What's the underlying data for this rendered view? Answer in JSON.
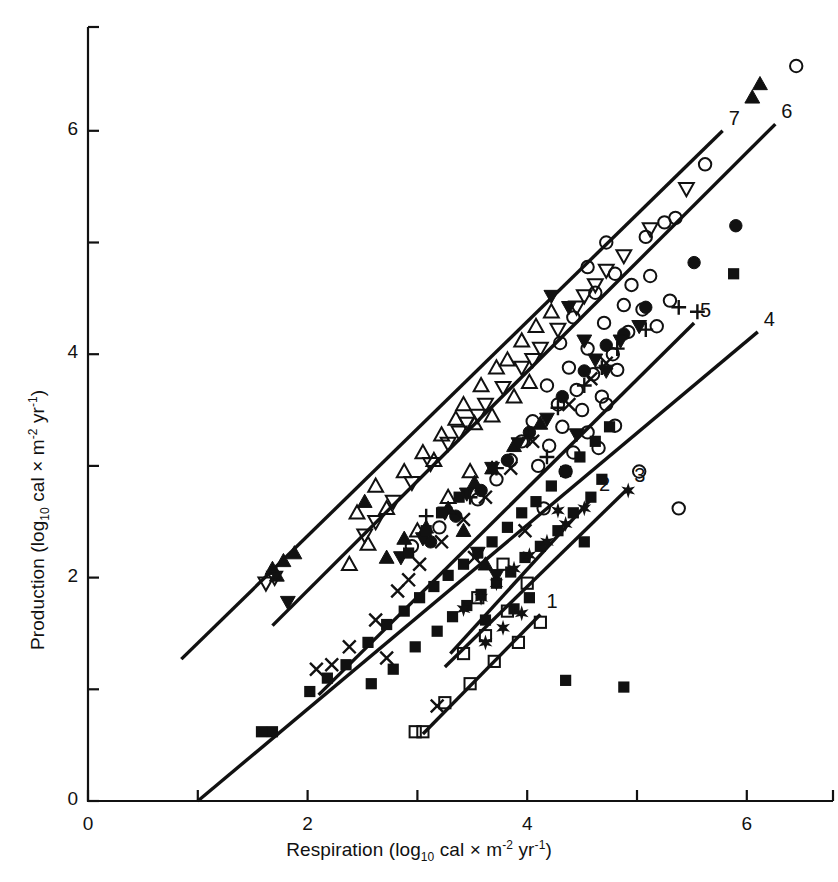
{
  "figure": {
    "background": "#ffffff",
    "ink": "#111111"
  },
  "axes": {
    "x": {
      "title_main": "Respiration (log",
      "title_sub": "10",
      "title_mid": " cal × m",
      "title_sup1": "-2",
      "title_mid2": " yr",
      "title_sup2": "-1",
      "title_end": ")",
      "ticks": [
        {
          "value": 0,
          "label": "0"
        },
        {
          "value": 1,
          "label": ""
        },
        {
          "value": 2,
          "label": "2"
        },
        {
          "value": 3,
          "label": ""
        },
        {
          "value": 4,
          "label": "4"
        },
        {
          "value": 5,
          "label": ""
        },
        {
          "value": 6,
          "label": "6"
        }
      ],
      "min": 0,
      "max": 6.8
    },
    "y": {
      "title_main": "Production (log",
      "title_sub": "10",
      "title_mid": " cal × m",
      "title_sup1": "-2",
      "title_mid2": " yr",
      "title_sup2": "-1",
      "title_end": ")",
      "ticks": [
        {
          "value": 0,
          "label": "0"
        },
        {
          "value": 1,
          "label": ""
        },
        {
          "value": 2,
          "label": "2"
        },
        {
          "value": 3,
          "label": ""
        },
        {
          "value": 4,
          "label": "4"
        },
        {
          "value": 5,
          "label": ""
        },
        {
          "value": 6,
          "label": "6"
        }
      ],
      "min": 0,
      "max": 6.9
    }
  },
  "chart_data": {
    "type": "scatter",
    "title": "",
    "xlabel": "Respiration (log10 cal × m-2 yr-1)",
    "ylabel": "Production (log10 cal × m-2 yr-1)",
    "xlim": [
      0,
      6.8
    ],
    "ylim": [
      0,
      6.9
    ],
    "grid": false,
    "legend": "none",
    "line_labels": [
      "1",
      "2",
      "3",
      "4",
      "5",
      "6",
      "7"
    ],
    "fit_lines": [
      {
        "label": "1",
        "x0": 3.05,
        "y0": 0.6,
        "x1": 4.12,
        "y1": 1.67
      },
      {
        "label": "2",
        "x0": 3.3,
        "y0": 1.32,
        "x1": 4.6,
        "y1": 2.72
      },
      {
        "label": "3",
        "x0": 3.25,
        "y0": 1.2,
        "x1": 4.92,
        "y1": 2.8
      },
      {
        "label": "4",
        "x0": 1.0,
        "y0": 0.0,
        "x1": 6.1,
        "y1": 4.2
      },
      {
        "label": "5",
        "x0": 2.1,
        "y0": 0.95,
        "x1": 5.52,
        "y1": 4.28
      },
      {
        "label": "6",
        "x0": 1.68,
        "y0": 1.57,
        "x1": 6.26,
        "y1": 6.06
      },
      {
        "label": "7",
        "x0": 0.85,
        "y0": 1.27,
        "x1": 5.78,
        "y1": 6.0
      }
    ],
    "series": [
      {
        "name": "open-circle",
        "marker": "circle-open",
        "points": [
          [
            6.45,
            6.58
          ],
          [
            5.62,
            5.7
          ],
          [
            5.25,
            5.18
          ],
          [
            5.35,
            5.22
          ],
          [
            5.08,
            5.05
          ],
          [
            4.72,
            5.0
          ],
          [
            4.55,
            4.78
          ],
          [
            4.8,
            4.72
          ],
          [
            4.95,
            4.62
          ],
          [
            5.12,
            4.7
          ],
          [
            4.62,
            4.55
          ],
          [
            4.88,
            4.44
          ],
          [
            5.05,
            4.4
          ],
          [
            5.3,
            4.48
          ],
          [
            4.42,
            4.33
          ],
          [
            4.7,
            4.28
          ],
          [
            4.92,
            4.2
          ],
          [
            5.18,
            4.25
          ],
          [
            4.3,
            4.1
          ],
          [
            4.55,
            4.05
          ],
          [
            4.78,
            4.0
          ],
          [
            4.38,
            3.88
          ],
          [
            4.6,
            3.82
          ],
          [
            4.82,
            3.86
          ],
          [
            4.18,
            3.72
          ],
          [
            4.45,
            3.68
          ],
          [
            4.68,
            3.62
          ],
          [
            4.28,
            3.55
          ],
          [
            4.5,
            3.5
          ],
          [
            4.72,
            3.55
          ],
          [
            4.05,
            3.4
          ],
          [
            4.32,
            3.35
          ],
          [
            4.55,
            3.3
          ],
          [
            4.8,
            3.36
          ],
          [
            3.95,
            3.22
          ],
          [
            4.2,
            3.18
          ],
          [
            4.42,
            3.12
          ],
          [
            4.65,
            3.16
          ],
          [
            3.85,
            3.05
          ],
          [
            4.1,
            3.0
          ],
          [
            4.35,
            2.95
          ],
          [
            3.55,
            2.7
          ],
          [
            3.2,
            2.45
          ],
          [
            2.95,
            2.28
          ],
          [
            5.02,
            2.95
          ],
          [
            5.38,
            2.62
          ],
          [
            4.15,
            2.62
          ],
          [
            3.72,
            2.88
          ]
        ]
      },
      {
        "name": "filled-circle",
        "marker": "circle-filled",
        "points": [
          [
            5.9,
            5.15
          ],
          [
            5.52,
            4.82
          ],
          [
            5.08,
            4.42
          ],
          [
            4.72,
            4.08
          ],
          [
            4.32,
            3.62
          ],
          [
            4.02,
            3.3
          ],
          [
            3.82,
            3.05
          ],
          [
            3.58,
            2.78
          ],
          [
            3.35,
            2.55
          ],
          [
            4.52,
            3.85
          ],
          [
            3.12,
            2.32
          ],
          [
            4.88,
            4.18
          ]
        ]
      },
      {
        "name": "open-up-triangle",
        "marker": "triangle-up-open",
        "points": [
          [
            2.62,
            2.82
          ],
          [
            2.72,
            2.62
          ],
          [
            2.45,
            2.58
          ],
          [
            2.88,
            2.95
          ],
          [
            3.05,
            3.12
          ],
          [
            3.22,
            3.28
          ],
          [
            3.35,
            3.42
          ],
          [
            3.15,
            3.05
          ],
          [
            3.42,
            3.55
          ],
          [
            3.58,
            3.72
          ],
          [
            3.72,
            3.88
          ],
          [
            3.52,
            3.38
          ],
          [
            3.28,
            2.72
          ],
          [
            3.48,
            2.95
          ],
          [
            3.82,
            3.95
          ],
          [
            3.95,
            4.12
          ],
          [
            4.08,
            4.25
          ],
          [
            4.22,
            4.38
          ],
          [
            2.55,
            2.3
          ],
          [
            3.68,
            3.45
          ],
          [
            3.88,
            3.62
          ],
          [
            4.02,
            3.75
          ],
          [
            3.0,
            2.42
          ],
          [
            2.38,
            2.12
          ]
        ]
      },
      {
        "name": "filled-up-triangle",
        "marker": "triangle-up-filled",
        "points": [
          [
            6.12,
            6.42
          ],
          [
            6.05,
            6.3
          ],
          [
            3.88,
            3.18
          ],
          [
            3.52,
            2.85
          ],
          [
            3.28,
            2.62
          ],
          [
            3.08,
            2.45
          ],
          [
            2.88,
            2.35
          ],
          [
            2.72,
            2.18
          ],
          [
            1.88,
            2.22
          ],
          [
            1.78,
            2.15
          ],
          [
            1.68,
            2.08
          ],
          [
            1.72,
            2.02
          ],
          [
            3.68,
            2.98
          ],
          [
            4.12,
            3.38
          ],
          [
            2.52,
            2.68
          ],
          [
            3.42,
            2.42
          ],
          [
            3.62,
            2.12
          ]
        ]
      },
      {
        "name": "open-down-triangle",
        "marker": "triangle-down-open",
        "points": [
          [
            5.45,
            5.48
          ],
          [
            5.12,
            5.12
          ],
          [
            4.88,
            4.88
          ],
          [
            4.62,
            4.62
          ],
          [
            4.45,
            4.42
          ],
          [
            4.28,
            4.22
          ],
          [
            4.12,
            4.05
          ],
          [
            3.95,
            3.88
          ],
          [
            3.78,
            3.7
          ],
          [
            3.62,
            3.55
          ],
          [
            3.45,
            3.38
          ],
          [
            3.28,
            3.2
          ],
          [
            3.12,
            3.02
          ],
          [
            2.95,
            2.85
          ],
          [
            2.78,
            2.68
          ],
          [
            2.62,
            2.5
          ],
          [
            1.7,
            2.0
          ],
          [
            1.62,
            1.95
          ],
          [
            4.72,
            4.75
          ],
          [
            4.05,
            3.95
          ],
          [
            3.55,
            3.45
          ],
          [
            2.52,
            2.38
          ],
          [
            4.52,
            4.52
          ],
          [
            3.38,
            3.3
          ]
        ]
      },
      {
        "name": "filled-down-triangle",
        "marker": "triangle-down-filled",
        "points": [
          [
            4.22,
            4.52
          ],
          [
            4.38,
            4.42
          ],
          [
            4.52,
            4.12
          ],
          [
            4.62,
            3.95
          ],
          [
            4.72,
            3.85
          ],
          [
            4.18,
            3.42
          ],
          [
            3.92,
            3.2
          ],
          [
            3.68,
            2.98
          ],
          [
            3.45,
            2.75
          ],
          [
            3.25,
            2.58
          ],
          [
            3.05,
            2.35
          ],
          [
            2.85,
            2.18
          ],
          [
            1.82,
            1.78
          ],
          [
            4.85,
            4.12
          ],
          [
            4.45,
            3.28
          ],
          [
            3.55,
            2.22
          ],
          [
            3.72,
            2.02
          ],
          [
            5.02,
            4.25
          ]
        ]
      },
      {
        "name": "filled-square",
        "marker": "square-filled",
        "points": [
          [
            5.88,
            4.72
          ],
          [
            4.62,
            3.22
          ],
          [
            4.48,
            3.08
          ],
          [
            4.35,
            2.95
          ],
          [
            4.22,
            2.82
          ],
          [
            4.08,
            2.68
          ],
          [
            3.95,
            2.58
          ],
          [
            3.82,
            2.45
          ],
          [
            3.68,
            2.32
          ],
          [
            3.55,
            2.22
          ],
          [
            3.42,
            2.12
          ],
          [
            3.28,
            2.02
          ],
          [
            3.15,
            1.92
          ],
          [
            3.02,
            1.82
          ],
          [
            2.88,
            1.7
          ],
          [
            2.72,
            1.58
          ],
          [
            2.55,
            1.42
          ],
          [
            2.35,
            1.22
          ],
          [
            2.18,
            1.1
          ],
          [
            2.02,
            0.98
          ],
          [
            1.68,
            0.62
          ],
          [
            1.58,
            0.62
          ],
          [
            4.75,
            3.35
          ],
          [
            4.58,
            2.72
          ],
          [
            4.42,
            2.58
          ],
          [
            4.28,
            2.42
          ],
          [
            4.12,
            2.28
          ],
          [
            3.98,
            2.18
          ],
          [
            3.85,
            2.05
          ],
          [
            3.72,
            1.95
          ],
          [
            3.58,
            1.85
          ],
          [
            3.45,
            1.75
          ],
          [
            3.32,
            1.65
          ],
          [
            3.18,
            1.52
          ],
          [
            2.98,
            1.38
          ],
          [
            2.78,
            1.18
          ],
          [
            2.58,
            1.05
          ],
          [
            4.02,
            1.82
          ],
          [
            3.88,
            1.72
          ],
          [
            4.52,
            2.32
          ],
          [
            4.68,
            2.88
          ],
          [
            3.62,
            1.62
          ],
          [
            4.88,
            1.02
          ],
          [
            4.35,
            1.08
          ],
          [
            2.92,
            2.22
          ],
          [
            3.08,
            2.42
          ],
          [
            3.22,
            2.58
          ],
          [
            3.38,
            2.72
          ]
        ]
      },
      {
        "name": "open-square",
        "marker": "square-open",
        "points": [
          [
            4.12,
            1.6
          ],
          [
            3.92,
            1.42
          ],
          [
            3.7,
            1.25
          ],
          [
            3.48,
            1.05
          ],
          [
            3.25,
            0.88
          ],
          [
            3.05,
            0.62
          ],
          [
            3.62,
            1.48
          ],
          [
            3.82,
            1.7
          ],
          [
            3.42,
            1.32
          ],
          [
            4.0,
            1.95
          ],
          [
            3.78,
            2.12
          ],
          [
            2.98,
            0.62
          ],
          [
            3.55,
            1.82
          ]
        ]
      },
      {
        "name": "star",
        "marker": "star",
        "points": [
          [
            4.92,
            2.78
          ],
          [
            4.52,
            2.62
          ],
          [
            4.35,
            2.48
          ],
          [
            4.18,
            2.32
          ],
          [
            4.02,
            2.2
          ],
          [
            3.88,
            2.08
          ],
          [
            3.72,
            1.95
          ],
          [
            3.58,
            1.82
          ],
          [
            3.42,
            1.72
          ],
          [
            3.95,
            1.68
          ],
          [
            3.78,
            1.55
          ],
          [
            3.62,
            1.42
          ],
          [
            4.28,
            2.6
          ]
        ]
      },
      {
        "name": "cross-x",
        "marker": "x",
        "points": [
          [
            4.72,
            3.92
          ],
          [
            4.38,
            3.55
          ],
          [
            4.05,
            3.22
          ],
          [
            3.85,
            2.98
          ],
          [
            3.62,
            2.72
          ],
          [
            3.42,
            2.52
          ],
          [
            3.22,
            2.32
          ],
          [
            3.02,
            2.12
          ],
          [
            2.82,
            1.88
          ],
          [
            2.62,
            1.62
          ],
          [
            2.38,
            1.38
          ],
          [
            2.08,
            1.18
          ],
          [
            3.18,
            0.85
          ],
          [
            2.72,
            1.28
          ],
          [
            4.58,
            3.78
          ],
          [
            3.98,
            2.42
          ],
          [
            3.52,
            2.18
          ],
          [
            2.92,
            1.98
          ],
          [
            2.22,
            1.22
          ]
        ]
      },
      {
        "name": "plus",
        "marker": "plus",
        "points": [
          [
            5.38,
            4.42
          ],
          [
            5.08,
            4.22
          ],
          [
            4.82,
            4.05
          ],
          [
            4.52,
            3.72
          ],
          [
            4.28,
            3.52
          ],
          [
            4.02,
            3.25
          ],
          [
            3.72,
            2.98
          ],
          [
            3.48,
            2.72
          ],
          [
            3.08,
            2.55
          ],
          [
            5.55,
            4.38
          ],
          [
            4.68,
            3.88
          ],
          [
            4.18,
            3.08
          ]
        ]
      }
    ]
  }
}
